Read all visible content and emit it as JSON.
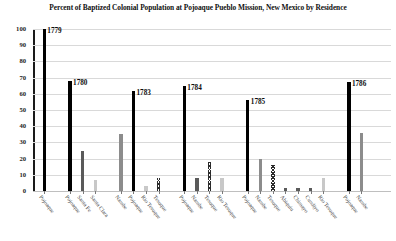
{
  "chart_data": {
    "type": "bar",
    "title": "Percent of Baptized Colonial Population at Pojoaque Pueblo Mission, New Mexico by Residence",
    "xlabel": "",
    "ylabel": "",
    "ylim": [
      0,
      100
    ],
    "y_ticks": [
      "0",
      "10",
      "20",
      "30",
      "40",
      "50",
      "60",
      "70",
      "80",
      "90",
      "100"
    ],
    "grid": true,
    "legend": "none",
    "groups": [
      {
        "year": "1779",
        "categories": [
          "Pojoaque"
        ],
        "values": [
          100
        ],
        "fills": [
          "black"
        ]
      },
      {
        "year": "1780",
        "categories": [
          "Pojoaque",
          "Santa Fe",
          "Santa Clara"
        ],
        "values": [
          68,
          25,
          7
        ],
        "fills": [
          "black",
          "dark",
          "light"
        ]
      },
      {
        "year": "1783",
        "categories": [
          "Nambe",
          "Pojoaque",
          "Rio Tesuque",
          "Tesuque"
        ],
        "values": [
          35,
          62,
          3,
          8
        ],
        "fills": [
          "mid",
          "black",
          "light",
          "hatch"
        ]
      },
      {
        "year": "1784",
        "categories": [
          "Pojoaque",
          "Nambe",
          "Tesuque",
          "Rio Tesuque"
        ],
        "values": [
          65,
          8,
          18,
          8
        ],
        "fills": [
          "black",
          "dark",
          "hatch",
          "light"
        ]
      },
      {
        "year": "1785",
        "categories": [
          "Pojoaque",
          "Nambe",
          "Tesuque",
          "Abiquiu",
          "Chimayo",
          "Cundiyo",
          "Rio Tesuque"
        ],
        "values": [
          56,
          20,
          16,
          2,
          2,
          2,
          8
        ],
        "fills": [
          "black",
          "mid",
          "hatch",
          "dark",
          "dark",
          "dark",
          "light"
        ]
      },
      {
        "year": "1786",
        "categories": [
          "Pojoaque",
          "Nambe"
        ],
        "values": [
          67,
          36
        ],
        "fills": [
          "black",
          "mid"
        ]
      }
    ],
    "colors": {
      "black": "#000000",
      "dark": "#5a5a5a",
      "mid": "#8c8c8c",
      "light": "#c8c8c8",
      "hatch": "#2b2b2b",
      "gridline": "#d9d9d9",
      "axis": "#1a1a1a"
    }
  }
}
